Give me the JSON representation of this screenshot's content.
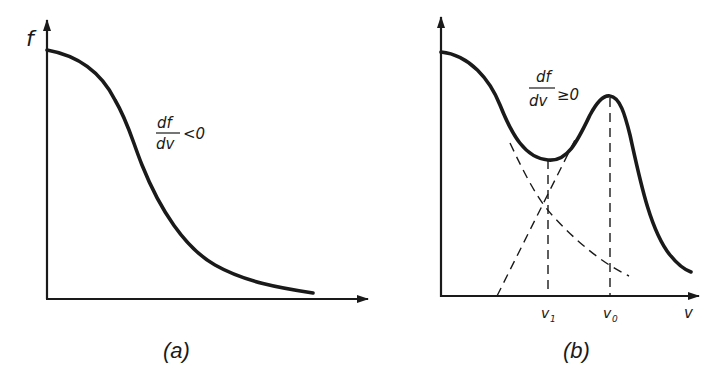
{
  "panels": [
    {
      "id": "a",
      "caption": "(a)",
      "y_axis_label": "f",
      "annotation": {
        "numerator": "df",
        "denominator": "dv",
        "relation": "<0"
      },
      "description": "Monotonically decreasing distribution function"
    },
    {
      "id": "b",
      "caption": "(b)",
      "x_axis_label": "v",
      "annotation": {
        "numerator": "df",
        "denominator": "dv",
        "relation": "≥0"
      },
      "tick_labels": {
        "v1": "v",
        "v1_sub": "1",
        "v0": "v",
        "v0_sub": "0"
      },
      "description": "Bump-on-tail distribution with minimum at v1 and secondary peak at v0; dashed lines show the two component distributions"
    }
  ],
  "colors": {
    "ink": "#1a1a1a",
    "background": "#ffffff"
  }
}
